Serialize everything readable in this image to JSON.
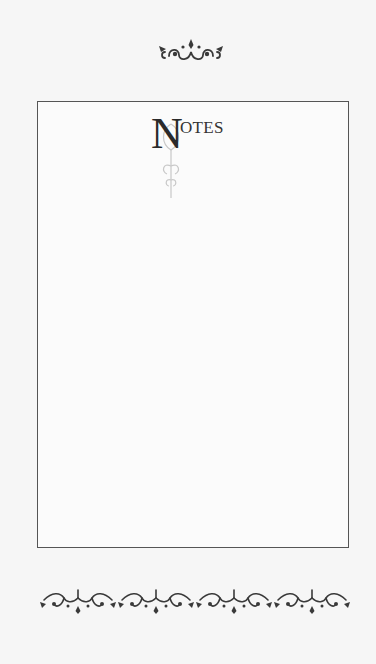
{
  "page": {
    "title_dropcap": "N",
    "title_rest": "OTES",
    "title_full": "Notes",
    "background_color": "#f6f6f6",
    "frame_color": "#555555",
    "ornament_color": "#3a3a3a"
  },
  "decorations": {
    "top": "flourish-ornament-icon",
    "bottom": "flourish-border-icon",
    "bottom_repeats": 4
  }
}
